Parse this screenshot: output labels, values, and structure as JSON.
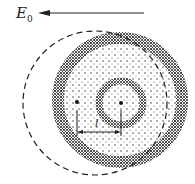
{
  "diagram": {
    "field_label": "E",
    "field_subscript": "0",
    "distance_label": "l",
    "elements": {
      "field_arrow": "arrow pointing left",
      "dashed_circle": "dashed outer circle (displaced electron cloud)",
      "dotted_disc": "stippled disc with dark rim",
      "inner_ring": "dark ring around nucleus",
      "centers": [
        "left center dot",
        "right center dot"
      ]
    }
  }
}
